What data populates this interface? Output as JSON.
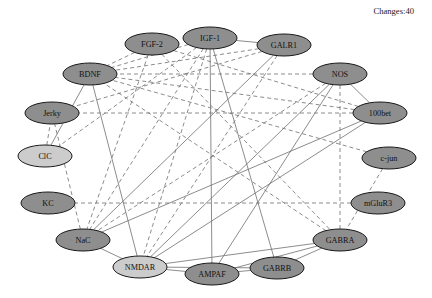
{
  "header": {
    "changes_label": "Changes:40"
  },
  "graph": {
    "title": "gene-interaction-network",
    "colors": {
      "node_fill_dark": "#8e8e8e",
      "node_fill_light": "#cccccc",
      "node_stroke": "#1a1a1a",
      "edge_color": "#6f6f6f",
      "background": "#ffffff",
      "text": "#111111"
    },
    "node_radius": {
      "rx": 27,
      "ry": 11
    },
    "nodes": [
      {
        "id": "FGF-2",
        "label": "FGF-2",
        "x": 152,
        "y": 44,
        "fill": "dark"
      },
      {
        "id": "IGF-1",
        "label": "IGF-1",
        "x": 210,
        "y": 38,
        "fill": "dark"
      },
      {
        "id": "GALR1",
        "label": "GALR1",
        "x": 284,
        "y": 45,
        "fill": "dark"
      },
      {
        "id": "NOS",
        "label": "NOS",
        "x": 340,
        "y": 74,
        "fill": "dark"
      },
      {
        "id": "100bet",
        "label": "100bet",
        "x": 380,
        "y": 113,
        "fill": "dark"
      },
      {
        "id": "c-jun",
        "label": "c-jun",
        "x": 389,
        "y": 158,
        "fill": "dark"
      },
      {
        "id": "mGluR3",
        "label": "mGluR3",
        "x": 378,
        "y": 203,
        "fill": "dark"
      },
      {
        "id": "GABRA",
        "label": "GABRA",
        "x": 340,
        "y": 240,
        "fill": "dark"
      },
      {
        "id": "GABRB",
        "label": "GABRB",
        "x": 277,
        "y": 268,
        "fill": "dark"
      },
      {
        "id": "AMPAF",
        "label": "AMPAF",
        "x": 212,
        "y": 274,
        "fill": "dark"
      },
      {
        "id": "NMDAR",
        "label": "NMDAR",
        "x": 140,
        "y": 267,
        "fill": "light"
      },
      {
        "id": "NaC",
        "label": "NaC",
        "x": 83,
        "y": 240,
        "fill": "dark"
      },
      {
        "id": "KC",
        "label": "KC",
        "x": 48,
        "y": 203,
        "fill": "dark"
      },
      {
        "id": "ClC",
        "label": "ClC",
        "x": 45,
        "y": 156,
        "fill": "light"
      },
      {
        "id": "Jerky",
        "label": "Jerky",
        "x": 52,
        "y": 113,
        "fill": "dark"
      },
      {
        "id": "BDNF",
        "label": "BDNF",
        "x": 90,
        "y": 74,
        "fill": "dark"
      }
    ],
    "edges": [
      {
        "from": "FGF-2",
        "to": "BDNF",
        "style": "dashed"
      },
      {
        "from": "FGF-2",
        "to": "NaC",
        "style": "dashed"
      },
      {
        "from": "FGF-2",
        "to": "GABRA",
        "style": "dashed"
      },
      {
        "from": "FGF-2",
        "to": "100bet",
        "style": "dashed"
      },
      {
        "from": "IGF-1",
        "to": "GALR1",
        "style": "solid"
      },
      {
        "from": "IGF-1",
        "to": "BDNF",
        "style": "dashed"
      },
      {
        "from": "IGF-1",
        "to": "NMDAR",
        "style": "dashed"
      },
      {
        "from": "IGF-1",
        "to": "AMPAF",
        "style": "solid"
      },
      {
        "from": "IGF-1",
        "to": "NaC",
        "style": "dashed"
      },
      {
        "from": "IGF-1",
        "to": "GABRB",
        "style": "solid"
      },
      {
        "from": "IGF-1",
        "to": "ClC",
        "style": "dashed"
      },
      {
        "from": "GALR1",
        "to": "BDNF",
        "style": "dashed"
      },
      {
        "from": "GALR1",
        "to": "NMDAR",
        "style": "dashed"
      },
      {
        "from": "GALR1",
        "to": "NaC",
        "style": "solid"
      },
      {
        "from": "GALR1",
        "to": "Jerky",
        "style": "dashed"
      },
      {
        "from": "NOS",
        "to": "100bet",
        "style": "solid"
      },
      {
        "from": "NOS",
        "to": "NMDAR",
        "style": "solid"
      },
      {
        "from": "NOS",
        "to": "AMPAF",
        "style": "solid"
      },
      {
        "from": "NOS",
        "to": "GABRA",
        "style": "dashed"
      },
      {
        "from": "NOS",
        "to": "BDNF",
        "style": "dashed"
      },
      {
        "from": "NOS",
        "to": "NaC",
        "style": "dashed"
      },
      {
        "from": "100bet",
        "to": "NaC",
        "style": "solid"
      },
      {
        "from": "100bet",
        "to": "NMDAR",
        "style": "solid"
      },
      {
        "from": "100bet",
        "to": "Jerky",
        "style": "dashed"
      },
      {
        "from": "100bet",
        "to": "BDNF",
        "style": "dashed"
      },
      {
        "from": "c-jun",
        "to": "GABRA",
        "style": "dashed"
      },
      {
        "from": "c-jun",
        "to": "BDNF",
        "style": "dashed"
      },
      {
        "from": "mGluR3",
        "to": "KC",
        "style": "dashed"
      },
      {
        "from": "GABRA",
        "to": "NMDAR",
        "style": "solid"
      },
      {
        "from": "GABRA",
        "to": "AMPAF",
        "style": "solid"
      },
      {
        "from": "GABRA",
        "to": "GABRB",
        "style": "solid"
      },
      {
        "from": "GABRA",
        "to": "BDNF",
        "style": "dashed"
      },
      {
        "from": "GABRB",
        "to": "NMDAR",
        "style": "solid"
      },
      {
        "from": "GABRB",
        "to": "AMPAF",
        "style": "solid"
      },
      {
        "from": "AMPAF",
        "to": "NMDAR",
        "style": "solid"
      },
      {
        "from": "NMDAR",
        "to": "NaC",
        "style": "solid"
      },
      {
        "from": "NMDAR",
        "to": "BDNF",
        "style": "solid"
      },
      {
        "from": "NaC",
        "to": "Jerky",
        "style": "dashed"
      },
      {
        "from": "ClC",
        "to": "Jerky",
        "style": "dashed"
      },
      {
        "from": "ClC",
        "to": "BDNF",
        "style": "solid"
      }
    ]
  }
}
